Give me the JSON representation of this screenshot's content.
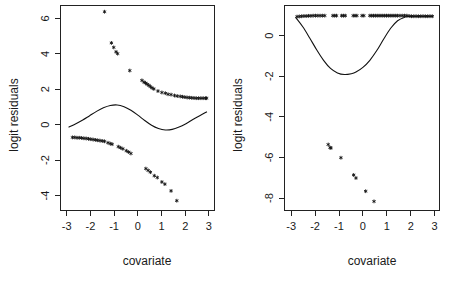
{
  "figure": {
    "background": "#ffffff",
    "foreground": "#111111",
    "panel_count": 2
  },
  "panels": [
    {
      "id": "left",
      "xlabel": "covariate",
      "ylabel": "logit residuals",
      "xticks": [
        "-3",
        "-2",
        "-1",
        "0",
        "1",
        "2",
        "3"
      ],
      "yticks": [
        "6",
        "4",
        "2",
        "0",
        "-2",
        "-4"
      ]
    },
    {
      "id": "right",
      "xlabel": "covariate",
      "ylabel": "logit residuals",
      "xticks": [
        "-3",
        "-2",
        "-1",
        "0",
        "1",
        "2",
        "3"
      ],
      "yticks": [
        "0",
        "-2",
        "-4",
        "-6",
        "-8"
      ]
    }
  ],
  "chart_data": [
    {
      "type": "scatter",
      "panel": "left",
      "title": "",
      "xlabel": "covariate",
      "ylabel": "logit residuals",
      "xlim": [
        -3.1,
        3.1
      ],
      "ylim": [
        -5.2,
        6.3
      ],
      "xticks": [
        -3,
        -2,
        -1,
        0,
        1,
        2,
        3
      ],
      "yticks": [
        6,
        4,
        2,
        0,
        -2,
        -4
      ],
      "grid": false,
      "legend": "none",
      "marker": "star",
      "series": [
        {
          "name": "upper residual band",
          "x": [
            -1.45,
            -1.15,
            -1.05,
            -0.95,
            -0.88,
            -0.35,
            0.18,
            0.27,
            0.34,
            0.41,
            0.48,
            0.55,
            0.62,
            0.7,
            0.88,
            1.05,
            1.2,
            1.32,
            1.45,
            1.6,
            1.72,
            1.85,
            1.95,
            2.05,
            2.15,
            2.25,
            2.35,
            2.45,
            2.55,
            2.65,
            2.75,
            2.85,
            2.95,
            3.0
          ],
          "y": [
            5.95,
            4.2,
            3.95,
            3.7,
            3.6,
            2.65,
            2.1,
            2.0,
            1.95,
            1.88,
            1.82,
            1.75,
            1.68,
            1.62,
            1.5,
            1.42,
            1.38,
            1.32,
            1.3,
            1.25,
            1.22,
            1.2,
            1.18,
            1.16,
            1.14,
            1.13,
            1.12,
            1.11,
            1.1,
            1.1,
            1.1,
            1.1,
            1.1,
            1.1
          ]
        },
        {
          "name": "lower residual band",
          "x": [
            -2.85,
            -2.75,
            -2.65,
            -2.55,
            -2.45,
            -2.35,
            -2.25,
            -2.15,
            -2.05,
            -1.95,
            -1.85,
            -1.75,
            -1.65,
            -1.55,
            -1.45,
            -1.3,
            -1.2,
            -1.12,
            -0.85,
            -0.75,
            -0.65,
            -0.5,
            -0.4,
            -0.3,
            0.35,
            0.45,
            0.55,
            0.72,
            0.85,
            1.05,
            1.18,
            1.45,
            1.7
          ],
          "y": [
            -1.1,
            -1.1,
            -1.12,
            -1.12,
            -1.13,
            -1.15,
            -1.16,
            -1.18,
            -1.2,
            -1.22,
            -1.24,
            -1.26,
            -1.28,
            -1.3,
            -1.32,
            -1.4,
            -1.45,
            -1.48,
            -1.62,
            -1.68,
            -1.74,
            -1.85,
            -1.92,
            -2.0,
            -2.85,
            -2.95,
            -3.05,
            -3.25,
            -3.35,
            -3.6,
            -3.72,
            -4.1,
            -4.65
          ]
        },
        {
          "name": "smooth fit",
          "type": "line",
          "x": [
            -3.0,
            -2.7,
            -2.4,
            -2.1,
            -1.8,
            -1.5,
            -1.2,
            -0.9,
            -0.6,
            -0.3,
            0.0,
            0.3,
            0.6,
            0.9,
            1.2,
            1.5,
            1.8,
            2.1,
            2.4,
            2.7,
            3.0
          ],
          "y": [
            -0.52,
            -0.33,
            -0.12,
            0.12,
            0.36,
            0.56,
            0.69,
            0.72,
            0.62,
            0.42,
            0.15,
            -0.15,
            -0.42,
            -0.6,
            -0.68,
            -0.65,
            -0.52,
            -0.33,
            -0.1,
            0.12,
            0.33
          ]
        }
      ]
    },
    {
      "type": "scatter",
      "panel": "right",
      "title": "",
      "xlabel": "covariate",
      "ylabel": "logit residuals",
      "xlim": [
        -3.1,
        3.1
      ],
      "ylim": [
        -8.6,
        1.5
      ],
      "xticks": [
        -3,
        -2,
        -1,
        0,
        1,
        2,
        3
      ],
      "yticks": [
        0,
        -2,
        -4,
        -6,
        -8
      ],
      "grid": false,
      "legend": "none",
      "marker": "star",
      "series": [
        {
          "name": "upper residual band",
          "x": [
            -2.85,
            -2.75,
            -2.65,
            -2.55,
            -2.45,
            -2.35,
            -2.25,
            -2.15,
            -2.05,
            -1.95,
            -1.85,
            -1.75,
            -1.65,
            -1.3,
            -1.22,
            -1.14,
            -0.92,
            -0.84,
            -0.76,
            -0.42,
            -0.34,
            -0.26,
            -0.04,
            0.04,
            0.3,
            0.38,
            0.46,
            0.54,
            0.62,
            0.7,
            0.78,
            0.86,
            0.94,
            1.02,
            1.1,
            1.18,
            1.26,
            1.34,
            1.42,
            1.5,
            1.6,
            1.7,
            1.8,
            1.9,
            2.0,
            2.1,
            2.2,
            2.3,
            2.4,
            2.5,
            2.6,
            2.7,
            2.8,
            2.9,
            3.0
          ],
          "y": [
            0.95,
            0.96,
            0.97,
            0.98,
            0.98,
            0.99,
            0.99,
            1.0,
            1.0,
            1.0,
            1.0,
            1.0,
            1.0,
            1.0,
            1.0,
            1.0,
            1.0,
            1.0,
            1.0,
            1.0,
            1.0,
            1.0,
            1.0,
            1.0,
            1.0,
            1.0,
            1.0,
            1.0,
            1.0,
            1.0,
            1.0,
            1.0,
            1.0,
            1.0,
            1.0,
            1.0,
            1.0,
            1.0,
            1.0,
            1.0,
            1.0,
            1.0,
            1.0,
            1.0,
            0.98,
            0.97,
            0.97,
            0.97,
            0.97,
            0.97,
            0.97,
            0.97,
            0.97,
            0.97,
            0.97
          ]
        },
        {
          "name": "lower residual band",
          "x": [
            -1.5,
            -1.42,
            -1.38,
            -0.95,
            -0.4,
            -0.3,
            0.12,
            0.48
          ],
          "y": [
            -5.35,
            -5.5,
            -5.52,
            -6.0,
            -6.85,
            -7.0,
            -7.65,
            -8.15
          ]
        },
        {
          "name": "smooth fit",
          "type": "line",
          "x": [
            -2.9,
            -2.6,
            -2.3,
            -2.0,
            -1.7,
            -1.4,
            -1.1,
            -0.8,
            -0.5,
            -0.3,
            0.0,
            0.3,
            0.6,
            0.9,
            1.2,
            1.5,
            1.8,
            2.0,
            2.2,
            2.5,
            2.8,
            3.0
          ],
          "y": [
            0.9,
            0.45,
            -0.1,
            -0.68,
            -1.2,
            -1.6,
            -1.82,
            -1.9,
            -1.86,
            -1.78,
            -1.55,
            -1.2,
            -0.72,
            -0.15,
            0.38,
            0.75,
            0.92,
            0.96,
            0.97,
            0.97,
            0.97,
            0.97
          ]
        }
      ]
    }
  ]
}
